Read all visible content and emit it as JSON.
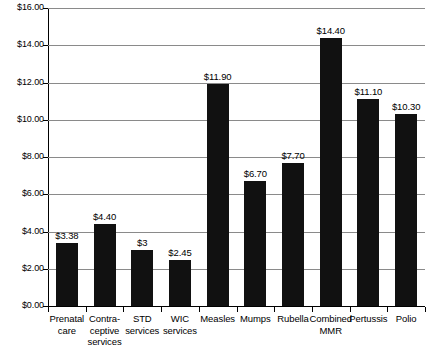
{
  "chart_data": {
    "type": "bar",
    "title": "",
    "subtitle": "",
    "xlabel": "",
    "ylabel": "",
    "ylim": [
      0,
      16
    ],
    "ytick_step": 2,
    "grid": true,
    "legend": "none",
    "orientation": "vertical",
    "bar_color": "#111111",
    "gridline_color": "#8a8a8a",
    "axis_color": "#000000",
    "background_color": "#ffffff",
    "ytick_labels": [
      "$16.00",
      "$14.00",
      "$12.00",
      "$10.00",
      "$8.00",
      "$6.00",
      "$4.00",
      "$2.00",
      "$0.00"
    ],
    "ytick_values": [
      16,
      14,
      12,
      10,
      8,
      6,
      4,
      2,
      0
    ],
    "categories": [
      "Prenatal care",
      "Contra-ceptive services",
      "STD services",
      "WIC services",
      "Measles",
      "Mumps",
      "Rubella",
      "Combined MMR",
      "Pertussis",
      "Polio"
    ],
    "category_lines": [
      [
        "Prenatal",
        "care"
      ],
      [
        "Contra-",
        "ceptive",
        "services"
      ],
      [
        "STD",
        "services"
      ],
      [
        "WIC",
        "services"
      ],
      [
        "Measles"
      ],
      [
        "Mumps"
      ],
      [
        "Rubella"
      ],
      [
        "Combined",
        "MMR"
      ],
      [
        "Pertussis"
      ],
      [
        "Polio"
      ]
    ],
    "values": [
      3.38,
      4.4,
      3.0,
      2.45,
      11.9,
      6.7,
      7.7,
      14.4,
      11.1,
      10.3
    ],
    "value_labels": [
      "$3.38",
      "$4.40",
      "$3",
      "$2.45",
      "$11.90",
      "$6.70",
      "$7.70",
      "$14.40",
      "$11.10",
      "$10.30"
    ]
  }
}
